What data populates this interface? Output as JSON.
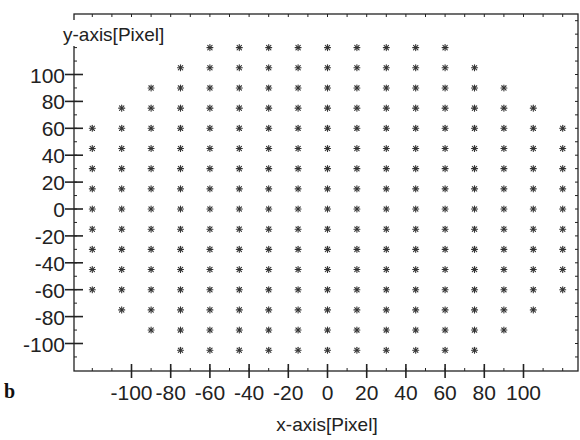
{
  "chart_data": {
    "type": "scatter",
    "title": "",
    "panel_label": "b",
    "xlabel": "x-axis[Pixel]",
    "ylabel": "y-axis[Pixel]",
    "xlim": [
      -126,
      128
    ],
    "ylim": [
      -121,
      145
    ],
    "x_ticks": [
      -100,
      -80,
      -60,
      -40,
      -20,
      0,
      20,
      40,
      60,
      80,
      100
    ],
    "y_ticks": [
      100,
      80,
      60,
      40,
      20,
      0,
      -20,
      -40,
      -60,
      -80,
      -100
    ],
    "grid": false,
    "legend": null,
    "marker": "asterisk",
    "grid_step": 15,
    "rows": [
      {
        "y": 120,
        "x_min": -60,
        "x_max": 60
      },
      {
        "y": 105,
        "x_min": -75,
        "x_max": 75
      },
      {
        "y": 90,
        "x_min": -90,
        "x_max": 90
      },
      {
        "y": 75,
        "x_min": -105,
        "x_max": 105
      },
      {
        "y": 60,
        "x_min": -120,
        "x_max": 120
      },
      {
        "y": 45,
        "x_min": -120,
        "x_max": 120
      },
      {
        "y": 30,
        "x_min": -120,
        "x_max": 120
      },
      {
        "y": 15,
        "x_min": -120,
        "x_max": 120
      },
      {
        "y": 0,
        "x_min": -120,
        "x_max": 120
      },
      {
        "y": -15,
        "x_min": -120,
        "x_max": 120
      },
      {
        "y": -30,
        "x_min": -120,
        "x_max": 120
      },
      {
        "y": -45,
        "x_min": -120,
        "x_max": 120
      },
      {
        "y": -60,
        "x_min": -120,
        "x_max": 120
      },
      {
        "y": -75,
        "x_min": -105,
        "x_max": 105
      },
      {
        "y": -90,
        "x_min": -90,
        "x_max": 90
      },
      {
        "y": -105,
        "x_min": -75,
        "x_max": 75
      }
    ],
    "total_points": 223
  },
  "colors": {
    "axis": "#222222",
    "marker": "#333333",
    "background": "#ffffff"
  }
}
